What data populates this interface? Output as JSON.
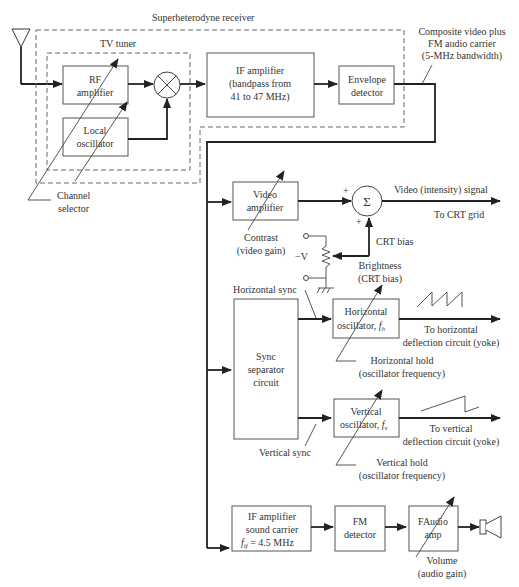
{
  "diagram": {
    "title": "Superheterodyne receiver",
    "tuner_label": "TV tuner",
    "blocks": {
      "rf_amp": [
        "RF",
        "amplifier"
      ],
      "local_osc": [
        "Local",
        "oscillator"
      ],
      "if_amp": [
        "IF amplifier",
        "(bandpass from",
        "41 to 47 MHz)"
      ],
      "envelope": [
        "Envelope",
        "detector"
      ],
      "video_amp": [
        "Video",
        "amplifier"
      ],
      "sync_sep": [
        "Sync",
        "separator",
        "circuit"
      ],
      "horiz_osc": [
        "Horizontal",
        "oscillator, "
      ],
      "horiz_osc_sym": "f",
      "horiz_osc_sub": "h",
      "vert_osc": [
        "Vertical",
        "oscillator, "
      ],
      "vert_osc_sym": "f",
      "vert_osc_sub": "v",
      "if_sound": [
        "IF amplifier",
        "sound carrier"
      ],
      "if_sound_eq_sym": "f",
      "if_sound_eq_sub": "if",
      "if_sound_eq_val": " = 4.5 MHz",
      "fm_det": [
        "FM",
        "detector"
      ],
      "audio_amp": [
        "FAudio",
        "amp"
      ]
    },
    "labels": {
      "composite": [
        "Composite video plus",
        "FM audio carrier",
        "(5-MHz bandwidth)"
      ],
      "channel_selector": [
        "Channel",
        "selector"
      ],
      "video_signal": "Video (intensity) signal",
      "to_crt_grid": "To CRT grid",
      "contrast": [
        "Contrast",
        "(video gain)"
      ],
      "crt_bias": "CRT bias",
      "minus_v": "−V",
      "brightness": [
        "Brightness",
        "(CRT bias)"
      ],
      "horizontal_sync": "Horizontal sync",
      "vertical_sync": "Vertical sync",
      "to_horizontal": [
        "To horizontal",
        "deflection circuit (yoke)"
      ],
      "horizontal_hold": [
        "Horizontal hold",
        "(oscillator frequency)"
      ],
      "to_vertical": [
        "To vertical",
        "deflection circuit (yoke)"
      ],
      "vertical_hold": [
        "Vertical hold",
        "(oscillator frequency)"
      ],
      "volume": [
        "Volume",
        "(audio gain)"
      ],
      "plus": "+",
      "sigma": "Σ"
    }
  }
}
